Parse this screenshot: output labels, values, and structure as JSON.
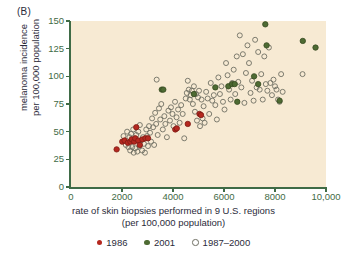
{
  "panel": {
    "label": "(B)"
  },
  "colors": {
    "plot_background": "#f7ead3",
    "axis": "#3f6b46",
    "tick_label": "#3f6b46",
    "text": "#2b2b3a",
    "series_1986_fill": "#b5281f",
    "series_1986_stroke": "#7d1a14",
    "series_2001_fill": "#4e6b33",
    "series_2001_stroke": "#35491f",
    "series_open_stroke": "#6f6f63",
    "page_background": "#ffffff"
  },
  "axes": {
    "x": {
      "title_line1": "rate of skin biopsies performed in 9 U.S. regions",
      "title_line2": "(per 100,000 population)",
      "ticks": [
        {
          "value": 0,
          "label": "0"
        },
        {
          "value": 2000,
          "label": "2000"
        },
        {
          "value": 4000,
          "label": "4000"
        },
        {
          "value": 6000,
          "label": "6000"
        },
        {
          "value": 8000,
          "label": "8000"
        },
        {
          "value": 10000,
          "label": "10,000"
        }
      ],
      "min": 0,
      "max": 10000
    },
    "y": {
      "title_line1": "melanoma incidence",
      "title_line2": "per 100,000 population",
      "ticks": [
        {
          "value": 0,
          "label": "0"
        },
        {
          "value": 25,
          "label": "25"
        },
        {
          "value": 50,
          "label": "50"
        },
        {
          "value": 75,
          "label": "75"
        },
        {
          "value": 100,
          "label": "100"
        },
        {
          "value": 125,
          "label": "125"
        },
        {
          "value": 150,
          "label": "150"
        }
      ],
      "min": 0,
      "max": 150
    }
  },
  "legend": {
    "items": [
      {
        "label": "1986",
        "marker": "filled-circle-red",
        "series": "1986"
      },
      {
        "label": "2001",
        "marker": "filled-circle-green",
        "series": "2001"
      },
      {
        "label": "1987–2000",
        "marker": "open-circle",
        "series": "1987-2000"
      }
    ]
  },
  "chart_data": {
    "type": "scatter",
    "title": "",
    "xlabel": "rate of skin biopsies performed in 9 U.S. regions (per 100,000 population)",
    "ylabel": "melanoma incidence per 100,000 population",
    "xlim": [
      0,
      10000
    ],
    "ylim": [
      0,
      150
    ],
    "grid": false,
    "legend_position": "below",
    "series": [
      {
        "name": "1986",
        "marker": "filled-circle",
        "color": "#b5281f",
        "points": [
          [
            1790,
            34
          ],
          [
            2010,
            41
          ],
          [
            2100,
            42
          ],
          [
            2230,
            40
          ],
          [
            2330,
            41
          ],
          [
            2380,
            43
          ],
          [
            2480,
            41
          ],
          [
            2520,
            44
          ],
          [
            2560,
            54
          ],
          [
            2640,
            42
          ],
          [
            2700,
            38
          ],
          [
            2800,
            43
          ],
          [
            2920,
            44
          ],
          [
            3020,
            44
          ],
          [
            4090,
            52
          ],
          [
            4150,
            53
          ],
          [
            4580,
            57
          ],
          [
            5040,
            66
          ],
          [
            5100,
            65
          ]
        ]
      },
      {
        "name": "2001",
        "marker": "filled-circle",
        "color": "#4e6b33",
        "points": [
          [
            3560,
            88
          ],
          [
            3620,
            88
          ],
          [
            4820,
            84
          ],
          [
            5660,
            90
          ],
          [
            6170,
            91
          ],
          [
            6320,
            93
          ],
          [
            6420,
            93
          ],
          [
            6520,
            77
          ],
          [
            7180,
            100
          ],
          [
            7340,
            93
          ],
          [
            7620,
            147
          ],
          [
            7670,
            128
          ],
          [
            8180,
            78
          ],
          [
            9090,
            132
          ],
          [
            9590,
            126
          ]
        ]
      },
      {
        "name": "1987–2000",
        "marker": "open-circle",
        "color": "#6f6f63",
        "points": [
          [
            2060,
            46
          ],
          [
            2150,
            38
          ],
          [
            2200,
            50
          ],
          [
            2250,
            36
          ],
          [
            2290,
            45
          ],
          [
            2320,
            33
          ],
          [
            2360,
            48
          ],
          [
            2400,
            36
          ],
          [
            2440,
            52
          ],
          [
            2460,
            31
          ],
          [
            2520,
            35
          ],
          [
            2560,
            47
          ],
          [
            2600,
            32
          ],
          [
            2640,
            50
          ],
          [
            2680,
            37
          ],
          [
            2700,
            56
          ],
          [
            2740,
            42
          ],
          [
            2790,
            33
          ],
          [
            2820,
            45
          ],
          [
            2860,
            39
          ],
          [
            2900,
            31
          ],
          [
            2950,
            52
          ],
          [
            2980,
            46
          ],
          [
            3020,
            37
          ],
          [
            3060,
            55
          ],
          [
            3100,
            49
          ],
          [
            3140,
            41
          ],
          [
            3180,
            62
          ],
          [
            3220,
            54
          ],
          [
            3260,
            38
          ],
          [
            3300,
            67
          ],
          [
            3340,
            57
          ],
          [
            3360,
            97
          ],
          [
            3400,
            47
          ],
          [
            3450,
            71
          ],
          [
            3500,
            61
          ],
          [
            3540,
            75
          ],
          [
            3600,
            52
          ],
          [
            3660,
            64
          ],
          [
            3700,
            57
          ],
          [
            3760,
            45
          ],
          [
            3820,
            69
          ],
          [
            3880,
            60
          ],
          [
            3920,
            72
          ],
          [
            3980,
            66
          ],
          [
            4020,
            55
          ],
          [
            4080,
            77
          ],
          [
            4140,
            63
          ],
          [
            4200,
            70
          ],
          [
            4260,
            58
          ],
          [
            4320,
            74
          ],
          [
            4380,
            66
          ],
          [
            4440,
            44
          ],
          [
            4500,
            80
          ],
          [
            4540,
            85
          ],
          [
            4580,
            96
          ],
          [
            4620,
            88
          ],
          [
            4660,
            79
          ],
          [
            4700,
            83
          ],
          [
            4740,
            87
          ],
          [
            4780,
            75
          ],
          [
            4820,
            91
          ],
          [
            4860,
            68
          ],
          [
            4900,
            84
          ],
          [
            4940,
            60
          ],
          [
            4980,
            81
          ],
          [
            5020,
            87
          ],
          [
            5060,
            55
          ],
          [
            5120,
            79
          ],
          [
            5160,
            62
          ],
          [
            5200,
            73
          ],
          [
            5240,
            58
          ],
          [
            5300,
            86
          ],
          [
            5360,
            80
          ],
          [
            5420,
            66
          ],
          [
            5480,
            94
          ],
          [
            5540,
            78
          ],
          [
            5600,
            83
          ],
          [
            5660,
            74
          ],
          [
            5720,
            61
          ],
          [
            5780,
            99
          ],
          [
            5840,
            84
          ],
          [
            5900,
            91
          ],
          [
            5960,
            77
          ],
          [
            6020,
            70
          ],
          [
            6080,
            112
          ],
          [
            6140,
            101
          ],
          [
            6200,
            88
          ],
          [
            6260,
            79
          ],
          [
            6320,
            94
          ],
          [
            6380,
            106
          ],
          [
            6440,
            84
          ],
          [
            6500,
            118
          ],
          [
            6560,
            95
          ],
          [
            6620,
            137
          ],
          [
            6680,
            90
          ],
          [
            6740,
            120
          ],
          [
            6800,
            76
          ],
          [
            6860,
            103
          ],
          [
            6920,
            128
          ],
          [
            6980,
            112
          ],
          [
            7040,
            85
          ],
          [
            7100,
            96
          ],
          [
            7160,
            78
          ],
          [
            7220,
            133
          ],
          [
            7280,
            90
          ],
          [
            7340,
            122
          ],
          [
            7400,
            88
          ],
          [
            7460,
            102
          ],
          [
            7520,
            79
          ],
          [
            7580,
            118
          ],
          [
            7640,
            93
          ],
          [
            7700,
            87
          ],
          [
            7760,
            126
          ],
          [
            7820,
            94
          ],
          [
            7880,
            83
          ],
          [
            7940,
            97
          ],
          [
            8000,
            91
          ],
          [
            8060,
            88
          ],
          [
            8120,
            79
          ],
          [
            8180,
            77
          ],
          [
            8240,
            102
          ],
          [
            8300,
            86
          ],
          [
            9080,
            102
          ]
        ]
      }
    ]
  }
}
